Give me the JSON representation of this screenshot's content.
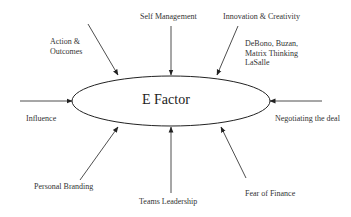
{
  "diagram": {
    "center": {
      "label": "E Factor"
    },
    "inputs": {
      "action_outcomes": {
        "line1": "Action &",
        "line2": "Outcomes"
      },
      "self_management": {
        "label": "Self Management"
      },
      "innovation_creativity": {
        "label": "Innovation & Creativity"
      },
      "innovation_note": {
        "line1": "DeBono, Buzan,",
        "line2": "Matrix Thinking",
        "line3": "LaSalle"
      },
      "influence": {
        "label": "Influence"
      },
      "negotiating": {
        "label": "Negotiating the deal"
      },
      "personal_branding": {
        "label": "Personal Branding"
      },
      "teams_leadership": {
        "label": "Teams Leadership"
      },
      "fear_of_finance": {
        "label": "Fear of Finance"
      }
    },
    "colors": {
      "stroke": "#222222",
      "text": "#333333",
      "background": "#ffffff"
    }
  }
}
